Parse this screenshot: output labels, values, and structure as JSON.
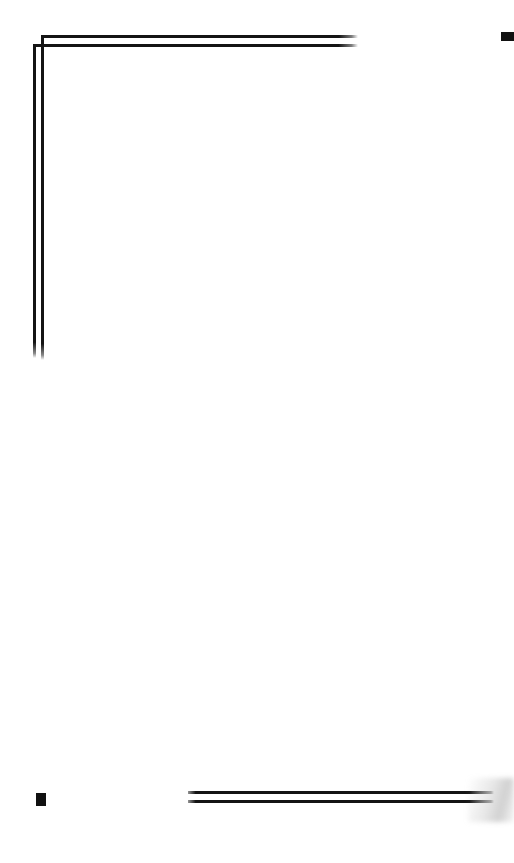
{
  "page": {
    "width": 514,
    "height": 863,
    "background_color": "#ffffff",
    "content_text": ""
  },
  "colors": {
    "paper": "#ffffff",
    "ink": "#141414",
    "fiducial": "#111111",
    "scan_fade": "#969696"
  },
  "marks": {
    "top_right_fiducial": {
      "name": "registration-mark",
      "x": 501,
      "y": 32,
      "width": 13,
      "height": 9,
      "color": "#111111",
      "clipped": "right-edge"
    },
    "bottom_left_fiducial": {
      "name": "registration-mark",
      "x": 36,
      "y": 793,
      "width": 10,
      "height": 13,
      "color": "#111111",
      "clipped": "none"
    }
  },
  "rules": {
    "top_frame": {
      "shape": "L-corner",
      "horizontal_outer": {
        "x": 41,
        "y": 35,
        "length": 317,
        "thickness": 3
      },
      "horizontal_inner": {
        "x": 33,
        "y": 44,
        "length": 325,
        "thickness": 3
      },
      "vertical_outer": {
        "x": 41,
        "y": 35,
        "length": 325,
        "thickness": 3
      },
      "vertical_inner": {
        "x": 33,
        "y": 44,
        "length": 314,
        "thickness": 3
      },
      "end_style": "faded-taper"
    },
    "footer_rules": {
      "count": 2,
      "upper": {
        "x": 188,
        "y": 791,
        "length": 306,
        "thickness": 3
      },
      "lower": {
        "x": 188,
        "y": 800,
        "length": 306,
        "thickness": 3
      },
      "end_style": "faded-taper"
    }
  },
  "artifacts": {
    "scan_fade_wedge": {
      "x": 468,
      "y": 778,
      "width": 46,
      "height": 44,
      "color": "#969696",
      "note": "soft gray gradient where footer rules dissolve at right edge"
    }
  }
}
